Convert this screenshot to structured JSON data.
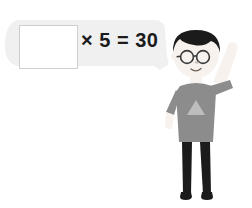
{
  "scene": {
    "title": "Math practice question with cartoon boy",
    "background_color": "#ffffff"
  },
  "speech_bubble": {
    "name": "speech-bubble",
    "fill_color": "#f0f0f0",
    "question_prefix": "",
    "equation_text": "× 5 = 30",
    "operator": "×",
    "multiplier": "5",
    "equals": "=",
    "product": "30",
    "answer_box": {
      "value": "",
      "placeholder": "",
      "border_color": "#cfcfcf",
      "fill_color": "#ffffff"
    }
  },
  "character": {
    "name": "cartoon-boy",
    "hair_color": "#1b1b1b",
    "skin_color": "#f7f2ee",
    "shirt_color": "#8c8c8c",
    "shirt_motif_color": "#bdbdbd",
    "pants_color": "#1b1b1b",
    "shoes_color": "#1b1b1b",
    "glasses_color": "#3a3a3a",
    "pose": "right-arm-raised",
    "expression": "smiling"
  }
}
